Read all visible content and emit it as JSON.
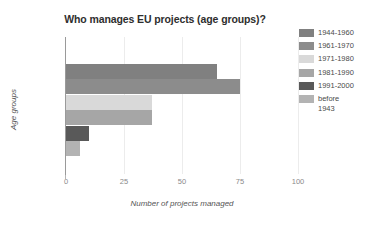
{
  "chart_data": {
    "type": "bar",
    "orientation": "horizontal",
    "title": "Who manages EU projects (age groups)?",
    "xlabel": "Number of projects managed",
    "ylabel": "Age groups",
    "categories": [
      "1944-1960",
      "1961-1970",
      "1971-1980",
      "1981-1990",
      "1991-2000",
      "before 1943"
    ],
    "values": [
      65,
      75,
      37,
      37,
      10,
      6
    ],
    "colors": [
      "#808080",
      "#8c8c8c",
      "#d9d9d9",
      "#a6a6a6",
      "#595959",
      "#b3b3b3"
    ],
    "xlim": [
      0,
      100
    ],
    "xticks": [
      0,
      25,
      50,
      75,
      100
    ],
    "xtick_labels": [
      "0",
      "25",
      "50",
      "75",
      "100"
    ],
    "grid": "vertical-light",
    "legend_position": "right",
    "legend_entries": [
      {
        "label": "1944-1960",
        "color": "#808080"
      },
      {
        "label": "1961-1970",
        "color": "#8c8c8c"
      },
      {
        "label": "1971-1980",
        "color": "#d9d9d9"
      },
      {
        "label": "1981-1990",
        "color": "#a6a6a6"
      },
      {
        "label": "1991-2000",
        "color": "#595959"
      },
      {
        "label": "before\n1943",
        "color": "#b3b3b3"
      }
    ]
  }
}
